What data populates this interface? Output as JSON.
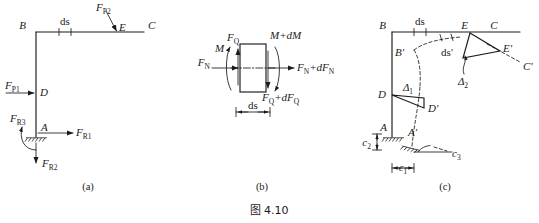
{
  "figure": {
    "caption": "图 4.10",
    "panels": [
      {
        "id": "a",
        "label": "(a)"
      },
      {
        "id": "b",
        "label": "(b)"
      },
      {
        "id": "c",
        "label": "(c)"
      }
    ]
  },
  "panel_a": {
    "name": "original-frame-free-body",
    "points": {
      "B": "B",
      "C": "C",
      "D": "D",
      "E": "E",
      "A": "A"
    },
    "dimension": {
      "ds": "ds"
    },
    "loads": {
      "FP1": {
        "base": "F",
        "sub": "P1"
      },
      "FP2": {
        "base": "F",
        "sub": "P2"
      }
    },
    "reactions": {
      "FR1": {
        "base": "F",
        "sub": "R1"
      },
      "FR2": {
        "base": "F",
        "sub": "R2"
      },
      "FR3": {
        "base": "F",
        "sub": "R3"
      }
    }
  },
  "panel_b": {
    "name": "differential-element-internal-forces",
    "left_face": {
      "M": "M",
      "FQ": {
        "base": "F",
        "sub": "Q"
      },
      "FN": {
        "base": "F",
        "sub": "N"
      }
    },
    "right_face": {
      "M_dM": "M+dM",
      "FN_dFN": {
        "pre": "F",
        "sub1": "N",
        "mid": "+d",
        "post": "F",
        "sub2": "N"
      },
      "FQ_dFQ": {
        "pre": "F",
        "sub1": "Q",
        "mid": "+d",
        "post": "F",
        "sub2": "Q"
      }
    },
    "dimension": {
      "ds": "ds"
    }
  },
  "panel_c": {
    "name": "deformed-frame-displacements",
    "points": {
      "B": "B",
      "C": "C",
      "E": "E",
      "B_p": "B'",
      "C_p": "C'",
      "E_p": "E'",
      "D": "D",
      "D_p": "D'",
      "A": "A",
      "A_p": "A'"
    },
    "dimensions": {
      "ds": "ds",
      "ds_p": "ds'"
    },
    "displacements": {
      "delta1": {
        "base": "Δ",
        "sub": "1"
      },
      "delta2": {
        "base": "Δ",
        "sub": "2"
      }
    },
    "support_movements": {
      "c1": {
        "base": "c",
        "sub": "1"
      },
      "c2": {
        "base": "c",
        "sub": "2"
      },
      "c3": {
        "base": "c",
        "sub": "3"
      }
    }
  },
  "colors": {
    "ink": "#1a1a1a",
    "background": "#ffffff"
  }
}
